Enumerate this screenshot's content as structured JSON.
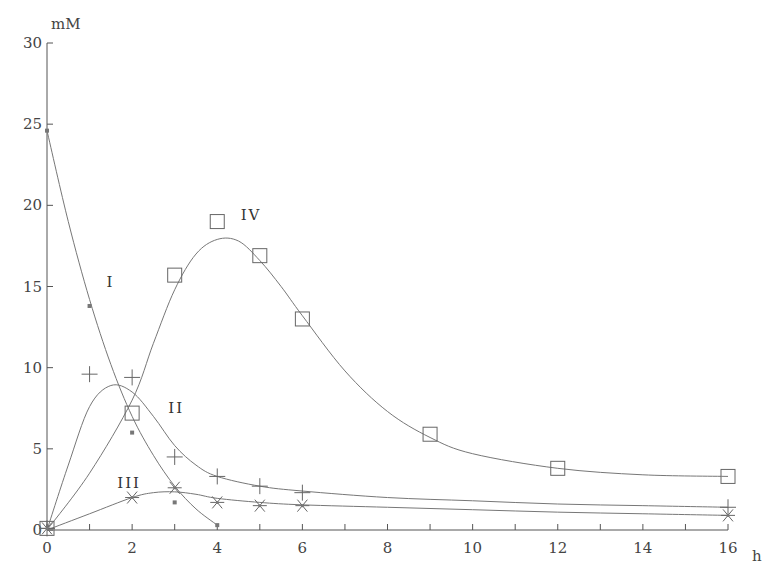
{
  "chart_data": {
    "type": "scatter",
    "title": "",
    "xlabel": "h",
    "ylabel": "mM",
    "xlim": [
      0,
      16
    ],
    "ylim": [
      0,
      30
    ],
    "x_ticks": [
      0,
      2,
      4,
      6,
      8,
      10,
      12,
      14,
      16
    ],
    "y_ticks": [
      0,
      5,
      10,
      15,
      20,
      25,
      30
    ],
    "grid": false,
    "legend": "inline curve labels",
    "series": [
      {
        "name": "I",
        "marker": "small-filled-square",
        "x": [
          0,
          1,
          2,
          3,
          4
        ],
        "y": [
          24.6,
          13.8,
          6.0,
          1.7,
          0.3
        ],
        "fit_curve": [
          [
            0,
            24.6
          ],
          [
            0.5,
            19.0
          ],
          [
            1,
            14.2
          ],
          [
            1.5,
            10.2
          ],
          [
            2,
            7.0
          ],
          [
            2.5,
            4.6
          ],
          [
            3,
            2.7
          ],
          [
            3.5,
            1.3
          ],
          [
            4,
            0.3
          ]
        ],
        "label_pos": [
          1.4,
          15.0
        ]
      },
      {
        "name": "II",
        "marker": "plus",
        "x": [
          0,
          1,
          2,
          3,
          4,
          5,
          6,
          16
        ],
        "y": [
          0.1,
          9.6,
          9.4,
          4.5,
          3.3,
          2.7,
          2.3,
          1.4
        ],
        "fit_curve": [
          [
            0,
            0
          ],
          [
            0.5,
            4.0
          ],
          [
            1,
            7.6
          ],
          [
            1.5,
            8.9
          ],
          [
            2,
            8.5
          ],
          [
            2.5,
            7.0
          ],
          [
            3,
            5.2
          ],
          [
            3.5,
            4.0
          ],
          [
            4,
            3.3
          ],
          [
            5,
            2.7
          ],
          [
            6,
            2.4
          ],
          [
            8,
            2.0
          ],
          [
            10,
            1.8
          ],
          [
            12,
            1.6
          ],
          [
            14,
            1.5
          ],
          [
            16,
            1.4
          ]
        ],
        "label_pos": [
          2.85,
          7.2
        ]
      },
      {
        "name": "III",
        "marker": "asterisk",
        "x": [
          0,
          2,
          3,
          4,
          5,
          6,
          16
        ],
        "y": [
          0.1,
          2.0,
          2.6,
          1.7,
          1.5,
          1.5,
          0.9
        ],
        "fit_curve": [
          [
            0,
            0
          ],
          [
            1,
            1.0
          ],
          [
            2,
            2.0
          ],
          [
            2.5,
            2.3
          ],
          [
            3,
            2.35
          ],
          [
            3.5,
            2.2
          ],
          [
            4,
            1.95
          ],
          [
            5,
            1.7
          ],
          [
            6,
            1.55
          ],
          [
            8,
            1.4
          ],
          [
            10,
            1.25
          ],
          [
            12,
            1.1
          ],
          [
            14,
            1.0
          ],
          [
            16,
            0.9
          ]
        ],
        "label_pos": [
          1.65,
          2.6
        ]
      },
      {
        "name": "IV",
        "marker": "open-square",
        "x": [
          0,
          2,
          3,
          4,
          5,
          6,
          9,
          12,
          16
        ],
        "y": [
          0.1,
          7.2,
          15.7,
          19.0,
          16.9,
          13.0,
          5.9,
          3.8,
          3.3
        ],
        "fit_curve": [
          [
            0,
            0
          ],
          [
            1,
            3.5
          ],
          [
            2,
            8.0
          ],
          [
            2.5,
            11.5
          ],
          [
            3,
            14.8
          ],
          [
            3.5,
            17.0
          ],
          [
            4,
            17.9
          ],
          [
            4.5,
            17.8
          ],
          [
            5,
            16.6
          ],
          [
            5.5,
            15.0
          ],
          [
            6,
            13.2
          ],
          [
            7,
            9.8
          ],
          [
            8,
            7.3
          ],
          [
            9,
            5.7
          ],
          [
            10,
            4.7
          ],
          [
            12,
            3.8
          ],
          [
            14,
            3.4
          ],
          [
            16,
            3.3
          ]
        ],
        "label_pos": [
          4.55,
          19.1
        ]
      }
    ]
  }
}
